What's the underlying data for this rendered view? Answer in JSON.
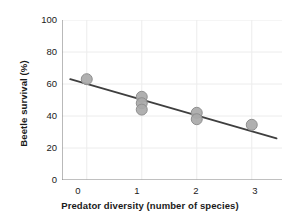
{
  "chart_data": {
    "type": "scatter",
    "title": "",
    "subtitle": "",
    "xlabel": "Predator diversity (number of species)",
    "ylabel": "Beetle survival (%)",
    "xlim": [
      -0.45,
      3.55
    ],
    "ylim": [
      0,
      100
    ],
    "xticks": [
      0,
      1,
      2,
      3
    ],
    "xtick_labels": [
      "0",
      "1",
      "2",
      "3"
    ],
    "yticks": [
      0,
      20,
      40,
      60,
      80,
      100
    ],
    "ytick_labels": [
      "0",
      "20",
      "40",
      "60",
      "80",
      "100"
    ],
    "grid": "horizontal-faint",
    "legend": "none",
    "annotations": [],
    "marker": {
      "shape": "circle",
      "fill_color": "#a9a9a9",
      "edge_color": "#8f8f8f",
      "size_px": 11,
      "opacity": 0.92
    },
    "series": [
      {
        "name": "Beetle survival",
        "type": "scatter",
        "x": [
          0,
          1,
          1,
          1,
          2,
          2,
          3
        ],
        "y": [
          63,
          52,
          48,
          44,
          42,
          38,
          34.5
        ]
      },
      {
        "name": "Linear fit",
        "type": "line",
        "color": "#3f3f3f",
        "width_px": 1.9,
        "x": [
          -0.3,
          3.45
        ],
        "y": [
          63,
          26
        ],
        "slope_per_species": -9.9,
        "intercept_at_x0": 60.0
      }
    ]
  },
  "axes": {
    "spine_color": "#8a8a8a",
    "grid_color": "#ececec",
    "tick_color": "#8a8a8a",
    "text_color": "#1a1a1a"
  }
}
